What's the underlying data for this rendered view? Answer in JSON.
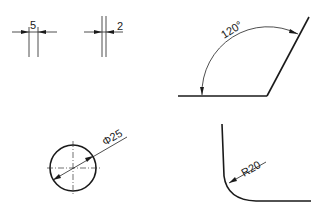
{
  "diagram": {
    "type": "technical-drawing-dimensioning-examples",
    "colors": {
      "line": "#1a1a1a",
      "background": "#ffffff"
    },
    "examples": [
      {
        "id": "linear-5",
        "kind": "linear-dimension",
        "label": "5",
        "note": "arrows outside extension lines"
      },
      {
        "id": "linear-2",
        "kind": "linear-dimension",
        "label": "2",
        "note": "arrows outside, text outside"
      },
      {
        "id": "angle-120",
        "kind": "angular-dimension",
        "label": "120°"
      },
      {
        "id": "diameter-25",
        "kind": "diameter-dimension",
        "label": "Φ25"
      },
      {
        "id": "radius-20",
        "kind": "radius-dimension",
        "label": "R20"
      }
    ]
  }
}
